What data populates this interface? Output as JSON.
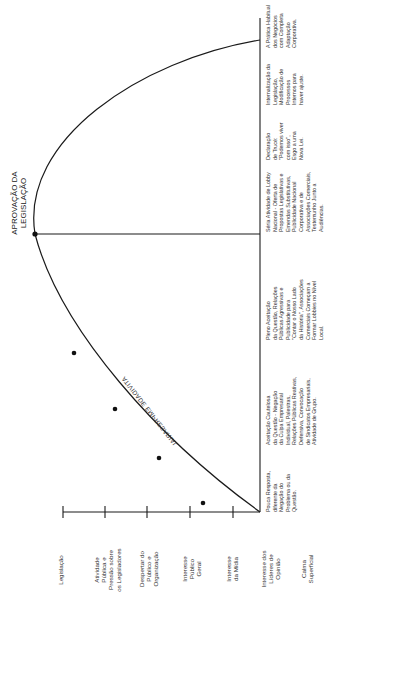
{
  "diagram": {
    "peak_label": "APROVAÇÃO DA\nLEGISLAÇÃO",
    "curve_label": "ATIVIDADE EMPRESARIAL",
    "levels": [
      {
        "label": "Legislação"
      },
      {
        "label": "Atividade\nPública e\nPressão sobre\nos Legisladores"
      },
      {
        "label": "Despertar do\nPúblico e\nOrganização"
      },
      {
        "label": "Interesse\nPúblico\nGeral"
      },
      {
        "label": "Interesse\nda Mídia"
      },
      {
        "label": "Interesse dos\nLíderes de\nOpinião"
      },
      {
        "label": "Calma\nSuperficial"
      }
    ],
    "stages": [
      {
        "text": "Pouca Resposta,\ndiferente da\nNegação do\nProblema ou da\nQuestão."
      },
      {
        "text": "Aceitação Cautelosa\nda Questão - Negação\nda Culpa Empresarial\nIndividual, Palestras,\nRelações Públicas Reativas,\nDefensiva, Convocação\nde Sindicatos Empresariais,\nAtividade de Grupo."
      },
      {
        "text": "Pleno Aceitação\nda Questão, Relações\nPúblicas Agressivas e\nPublicidade para\n\"Contar o Nosso Lado\nda História\", Associações\nComerciais Começam a\nFormar Lobbies no Nível\nLocal."
      },
      {
        "text": "Séria Atividade de Lobby\nNacional - Oferta de\nPropostas Legislativas e\nEmendas Substitutivas,\nPublicidade Nacional\nCorporativa e de\nAssociações Comerciais,\nTestemunho Junto a\nAudiências."
      },
      {
        "text": "Declaração\nde Trucé:\n\"Podemos viver\ncom isso\",\nEsgo a uma\nNova Lei."
      },
      {
        "text": "Internalização da\nLegislação,\nModificação de\nProcessos\nInternos para\nhaver ajuste."
      },
      {
        "text": "A Prática Habitual\ndos Negócios\ncom Completa\nAdaptação\nCorporativa."
      }
    ],
    "colors": {
      "line": "#1a1a1a",
      "text": "#333333",
      "background": "#ffffff"
    }
  }
}
